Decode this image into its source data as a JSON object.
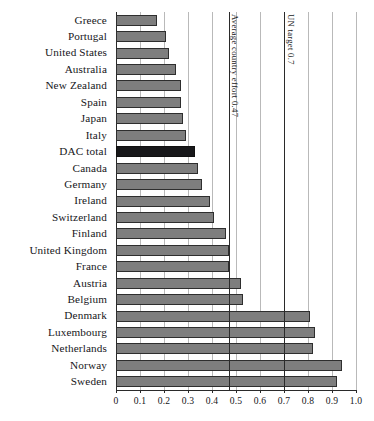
{
  "chart_data": {
    "type": "bar",
    "orientation": "horizontal",
    "title": "",
    "xlabel": "",
    "ylabel": "",
    "xlim": [
      0,
      1.0
    ],
    "grid": true,
    "legend": "none",
    "xticks": [
      "0",
      "0.1",
      "0.2",
      "0.3",
      "0.4",
      "0.5",
      "0.6",
      "0.7",
      "0.8",
      "0.9",
      "1.0"
    ],
    "xtick_values": [
      0,
      0.1,
      0.2,
      0.3,
      0.4,
      0.5,
      0.6,
      0.7,
      0.8,
      0.9,
      1.0
    ],
    "categories": [
      "Greece",
      "Portugal",
      "United States",
      "Australia",
      "New Zealand",
      "Spain",
      "Japan",
      "Italy",
      "DAC total",
      "Canada",
      "Germany",
      "Ireland",
      "Switzerland",
      "Finland",
      "United Kingdom",
      "France",
      "Austria",
      "Belgium",
      "Denmark",
      "Luxembourg",
      "Netherlands",
      "Norway",
      "Sweden"
    ],
    "values": [
      0.17,
      0.21,
      0.22,
      0.25,
      0.27,
      0.27,
      0.28,
      0.29,
      0.33,
      0.34,
      0.36,
      0.39,
      0.41,
      0.46,
      0.47,
      0.47,
      0.52,
      0.53,
      0.81,
      0.83,
      0.82,
      0.94,
      0.92
    ],
    "highlight_category": "DAC total",
    "annotations": [
      {
        "label": "Average country effort 0.47",
        "value": 0.47
      },
      {
        "label": "UN target 0.7",
        "value": 0.7
      }
    ],
    "colors": {
      "bar": "#7e7e7e",
      "bar_border": "#2e2e2e",
      "highlight_bar": "#18181a",
      "gridline": "#b9b9b9",
      "axis": "#2a2a2a",
      "background": "#ffffff",
      "text": "#16161a"
    }
  }
}
